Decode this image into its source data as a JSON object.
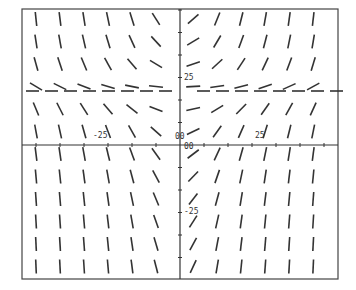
{
  "chart_data": {
    "type": "slope_field",
    "title": "",
    "xlabel": "",
    "ylabel": "",
    "frame": {
      "left": 22,
      "top": 9,
      "right": 338,
      "bottom": 279
    },
    "axes_origin_px": {
      "x": 180,
      "y": 145
    },
    "isocline_px_y": 91,
    "grid": {
      "cols": 14,
      "rows": 12
    },
    "tick_labels": {
      "x_negative": "-25",
      "x_positive": "25",
      "y_positive": "25",
      "y_negative": "-25",
      "origin_top": "00",
      "origin_right": "00"
    },
    "color": "#333333"
  }
}
